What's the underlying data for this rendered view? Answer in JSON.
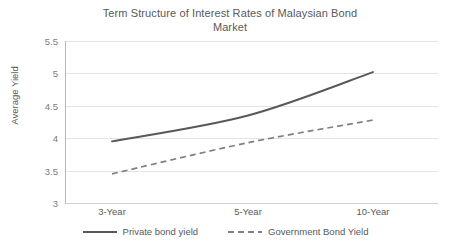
{
  "chart_data": {
    "type": "line",
    "title": "Term Structure of Interest Rates of Malaysian Bond Market",
    "title_line1": "Term Structure of Interest Rates of Malaysian Bond",
    "title_line2": "Market",
    "xlabel": "",
    "ylabel": "Average Yield",
    "categories": [
      "3-Year",
      "5-Year",
      "10-Year"
    ],
    "series": [
      {
        "name": "Private bond yield",
        "style": "solid",
        "color": "#595959",
        "values": [
          3.95,
          4.35,
          5.02
        ]
      },
      {
        "name": "Government Bond Yield",
        "style": "dashed",
        "color": "#808080",
        "values": [
          3.45,
          3.93,
          4.28
        ]
      }
    ],
    "ylim": [
      3,
      5.5
    ],
    "ytick_labels": [
      "5.5",
      "5",
      "4.5",
      "4",
      "3.5",
      "3"
    ],
    "ytick_values": [
      5.5,
      5,
      4.5,
      4,
      3.5,
      3
    ],
    "grid": true,
    "grid_axis": "y",
    "legend_position": "bottom",
    "smoothed": true
  },
  "axis": {
    "y_label": "Average Yield",
    "x_ticks": [
      "3-Year",
      "5-Year",
      "10-Year"
    ],
    "y_ticks": [
      "5.5",
      "5",
      "4.5",
      "4",
      "3.5",
      "3"
    ]
  },
  "legend": {
    "items": [
      {
        "label": "Private bond yield",
        "style": "solid",
        "color": "#595959"
      },
      {
        "label": "Government Bond Yield",
        "style": "dashed",
        "color": "#808080"
      }
    ]
  },
  "colors": {
    "private_line": "#595959",
    "government_line": "#808080",
    "gridline": "#e4e4e4",
    "axis": "#b7b7b7",
    "text": "#595959",
    "tick_text": "#7b7b7b",
    "background": "#ffffff"
  }
}
